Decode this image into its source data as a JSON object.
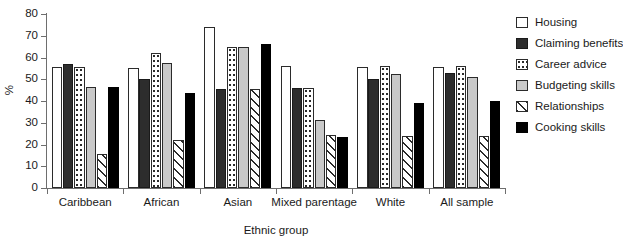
{
  "chart_data": {
    "type": "bar",
    "title": "",
    "xlabel": "Ethnic group",
    "ylabel": "%",
    "ylim": [
      0,
      80
    ],
    "yticks": [
      0,
      10,
      20,
      30,
      40,
      50,
      60,
      70,
      80
    ],
    "grid": false,
    "legend_position": "right",
    "categories": [
      "Caribbean",
      "African",
      "Asian",
      "Mixed parentage",
      "White",
      "All sample"
    ],
    "series": [
      {
        "name": "Housing",
        "pattern": "white",
        "color": "#ffffff",
        "values": [
          55.5,
          55.0,
          74.0,
          56.0,
          55.5,
          55.5
        ]
      },
      {
        "name": "Claiming benefits",
        "pattern": "dark-solid",
        "color": "#2d2d2d",
        "values": [
          57.0,
          50.0,
          45.5,
          46.0,
          50.0,
          53.0
        ]
      },
      {
        "name": "Career advice",
        "pattern": "dotted",
        "color": "#ffffff",
        "values": [
          55.5,
          62.0,
          65.0,
          46.0,
          56.0,
          56.0
        ]
      },
      {
        "name": "Budgeting skills",
        "pattern": "light-gray",
        "color": "#c9c9c9",
        "values": [
          46.5,
          57.5,
          65.0,
          31.5,
          52.5,
          51.0
        ]
      },
      {
        "name": "Relationships",
        "pattern": "diagonal-hatch",
        "color": "#ffffff",
        "values": [
          15.5,
          22.0,
          45.5,
          24.5,
          24.0,
          24.0
        ]
      },
      {
        "name": "Cooking skills",
        "pattern": "black-solid",
        "color": "#000000",
        "values": [
          46.5,
          43.5,
          66.0,
          23.5,
          39.0,
          40.0
        ]
      }
    ]
  },
  "axes": {
    "y_title": "%",
    "x_title": "Ethnic group",
    "y_tick_labels": [
      "0",
      "10",
      "20",
      "30",
      "40",
      "50",
      "60",
      "70",
      "80"
    ],
    "x_tick_labels": [
      "Caribbean",
      "African",
      "Asian",
      "Mixed parentage",
      "White",
      "All sample"
    ]
  },
  "legend": {
    "items": [
      {
        "label": "Housing"
      },
      {
        "label": "Claiming benefits"
      },
      {
        "label": "Career advice"
      },
      {
        "label": "Budgeting skills"
      },
      {
        "label": "Relationships"
      },
      {
        "label": "Cooking skills"
      }
    ]
  }
}
